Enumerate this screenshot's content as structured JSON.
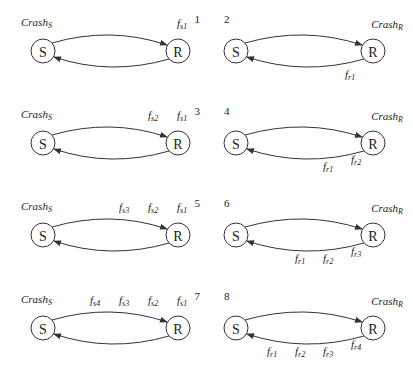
{
  "panels": [
    {
      "number": "1",
      "crash": {
        "base": "Crash",
        "sub": "S"
      },
      "side": "S",
      "node_s": "S",
      "node_r": "R",
      "labels": [
        {
          "base": "f",
          "sub": "s1"
        }
      ]
    },
    {
      "number": "2",
      "crash": {
        "base": "Crash",
        "sub": "R"
      },
      "side": "R",
      "node_s": "S",
      "node_r": "R",
      "labels": [
        {
          "base": "f",
          "sub": "r1"
        }
      ]
    },
    {
      "number": "3",
      "crash": {
        "base": "Crash",
        "sub": "S"
      },
      "side": "S",
      "node_s": "S",
      "node_r": "R",
      "labels": [
        {
          "base": "f",
          "sub": "s2"
        },
        {
          "base": "f",
          "sub": "s1"
        }
      ]
    },
    {
      "number": "4",
      "crash": {
        "base": "Crash",
        "sub": "R"
      },
      "side": "R",
      "node_s": "S",
      "node_r": "R",
      "labels": [
        {
          "base": "f",
          "sub": "r1"
        },
        {
          "base": "f",
          "sub": "r2"
        }
      ]
    },
    {
      "number": "5",
      "crash": {
        "base": "Crash",
        "sub": "S"
      },
      "side": "S",
      "node_s": "S",
      "node_r": "R",
      "labels": [
        {
          "base": "f",
          "sub": "s3"
        },
        {
          "base": "f",
          "sub": "s2"
        },
        {
          "base": "f",
          "sub": "s1"
        }
      ]
    },
    {
      "number": "6",
      "crash": {
        "base": "Crash",
        "sub": "R"
      },
      "side": "R",
      "node_s": "S",
      "node_r": "R",
      "labels": [
        {
          "base": "f",
          "sub": "r1"
        },
        {
          "base": "f",
          "sub": "r2"
        },
        {
          "base": "f",
          "sub": "r3"
        }
      ]
    },
    {
      "number": "7",
      "crash": {
        "base": "Crash",
        "sub": "S"
      },
      "side": "S",
      "node_s": "S",
      "node_r": "R",
      "labels": [
        {
          "base": "f",
          "sub": "s4"
        },
        {
          "base": "f",
          "sub": "s3"
        },
        {
          "base": "f",
          "sub": "s2"
        },
        {
          "base": "f",
          "sub": "s1"
        }
      ]
    },
    {
      "number": "8",
      "crash": {
        "base": "Crash",
        "sub": "R"
      },
      "side": "R",
      "node_s": "S",
      "node_r": "R",
      "labels": [
        {
          "base": "f",
          "sub": "r1"
        },
        {
          "base": "f",
          "sub": "r2"
        },
        {
          "base": "f",
          "sub": "r3"
        },
        {
          "base": "f",
          "sub": "r4"
        }
      ]
    }
  ]
}
